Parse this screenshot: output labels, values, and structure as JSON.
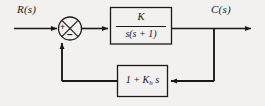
{
  "diagram": {
    "type": "control-system-block-diagram",
    "background_color": "#f2f1ef",
    "line_color": "#1a1a1a",
    "text_color": "#141414",
    "signals": {
      "input_label": "R(s)",
      "output_label": "C(s)"
    },
    "summing_junction": {
      "name": "summing-junction",
      "shape": "circle-with-cross",
      "input_sign": "+",
      "feedback_sign": "−"
    },
    "forward_block": {
      "name": "forward-path-block",
      "transfer_function": "K / s(s + 1)",
      "numerator": "K",
      "denominator": "s(s + 1)"
    },
    "feedback_block": {
      "name": "feedback-path-block",
      "transfer_function": "1 + K_h s",
      "expression_prefix": "1 + ",
      "gain_symbol": "K",
      "gain_subscript": "h",
      "expression_suffix": " s"
    }
  }
}
